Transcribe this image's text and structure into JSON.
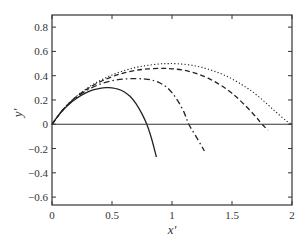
{
  "chart_data": {
    "type": "line",
    "title": "",
    "xlabel": "x'",
    "ylabel": "y'",
    "xlim": [
      0,
      2
    ],
    "ylim": [
      -0.665,
      0.9
    ],
    "xticks": [
      0,
      0.5,
      1,
      1.5,
      2
    ],
    "xtick_labels": [
      "0",
      "0.5",
      "1",
      "1.5",
      "2"
    ],
    "yticks": [
      0.8,
      0.6,
      0.4,
      0.2,
      0,
      -0.2,
      -0.4,
      -0.6
    ],
    "ytick_labels": [
      "0.8",
      "0.6",
      "0.4",
      "0.2",
      "0",
      "−0.2",
      "−0.4",
      "−0.6"
    ],
    "grid": false,
    "legend": null,
    "reference_line": {
      "y": 0,
      "style": "solid"
    },
    "series": [
      {
        "name": "solid",
        "style": "solid",
        "x": [
          0,
          0.05,
          0.1,
          0.15,
          0.2,
          0.25,
          0.3,
          0.35,
          0.4,
          0.45,
          0.5,
          0.55,
          0.6,
          0.65,
          0.7,
          0.75,
          0.79,
          0.83,
          0.87
        ],
        "y": [
          0,
          0.07,
          0.125,
          0.172,
          0.21,
          0.242,
          0.267,
          0.285,
          0.296,
          0.301,
          0.3,
          0.29,
          0.268,
          0.23,
          0.17,
          0.085,
          0,
          -0.12,
          -0.27
        ]
      },
      {
        "name": "dash-dot",
        "style": "dashdot",
        "x": [
          0,
          0.1,
          0.2,
          0.3,
          0.4,
          0.5,
          0.6,
          0.7,
          0.78,
          0.85,
          0.9,
          0.95,
          1.0,
          1.05,
          1.1,
          1.14,
          1.2,
          1.27
        ],
        "y": [
          0,
          0.13,
          0.22,
          0.285,
          0.33,
          0.358,
          0.372,
          0.376,
          0.372,
          0.36,
          0.34,
          0.31,
          0.26,
          0.19,
          0.1,
          0,
          -0.1,
          -0.22
        ]
      },
      {
        "name": "dashed",
        "style": "dashed",
        "x": [
          0,
          0.1,
          0.2,
          0.3,
          0.4,
          0.5,
          0.6,
          0.7,
          0.8,
          0.92,
          1.0,
          1.1,
          1.2,
          1.3,
          1.4,
          1.5,
          1.6,
          1.7,
          1.75,
          1.8
        ],
        "y": [
          0,
          0.13,
          0.225,
          0.295,
          0.35,
          0.392,
          0.423,
          0.444,
          0.456,
          0.46,
          0.457,
          0.445,
          0.42,
          0.38,
          0.325,
          0.255,
          0.165,
          0.06,
          0,
          -0.05
        ]
      },
      {
        "name": "dotted",
        "style": "dotted",
        "x": [
          0,
          0.1,
          0.2,
          0.3,
          0.4,
          0.5,
          0.6,
          0.7,
          0.8,
          0.9,
          0.97,
          1.05,
          1.15,
          1.25,
          1.35,
          1.45,
          1.55,
          1.65,
          1.75,
          1.85,
          1.95,
          2.0
        ],
        "y": [
          0,
          0.13,
          0.228,
          0.302,
          0.36,
          0.407,
          0.442,
          0.468,
          0.486,
          0.497,
          0.5,
          0.498,
          0.488,
          0.468,
          0.438,
          0.398,
          0.346,
          0.282,
          0.204,
          0.115,
          0.03,
          0
        ]
      }
    ]
  }
}
